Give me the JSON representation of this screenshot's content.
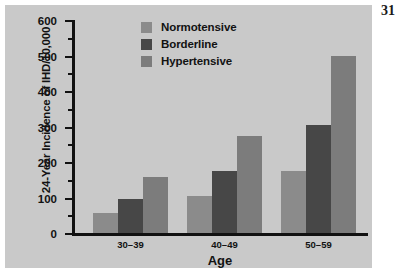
{
  "page": {
    "number": "31",
    "panel_color": "#c9c9c9",
    "background_color": "#ffffff"
  },
  "legend": {
    "position": "top-center",
    "items": [
      {
        "label": "Normotensive",
        "color": "#8b8b8b"
      },
      {
        "label": "Borderline",
        "color": "#474747"
      },
      {
        "label": "Hypertensive",
        "color": "#7c7c7c"
      }
    ]
  },
  "axes": {
    "y": {
      "label": "24-Year Incidence of IHD/10,000",
      "ticks": [
        "0",
        "100",
        "200",
        "300",
        "400",
        "500",
        "600"
      ],
      "min": 0,
      "max": 600,
      "major_step": 100,
      "minor_step": 50
    },
    "x": {
      "label": "Age",
      "categories": [
        "30–39",
        "40–49",
        "50–59"
      ]
    }
  },
  "chart_data": {
    "type": "bar",
    "title": "",
    "subtitle": "",
    "xlabel": "Age",
    "ylabel": "24-Year Incidence of IHD/10,000",
    "categories": [
      "30–39",
      "40–49",
      "50–59"
    ],
    "series": [
      {
        "name": "Normotensive",
        "color": "#8b8b8b",
        "values": [
          57,
          105,
          176
        ]
      },
      {
        "name": "Borderline",
        "color": "#474747",
        "values": [
          95,
          175,
          305
        ]
      },
      {
        "name": "Hypertensive",
        "color": "#7c7c7c",
        "values": [
          158,
          272,
          500
        ]
      }
    ],
    "ylim": [
      0,
      600
    ],
    "ytick_step": 100,
    "yminor_step": 50,
    "grid": false,
    "legend_position": "top-center",
    "grouped": true
  }
}
